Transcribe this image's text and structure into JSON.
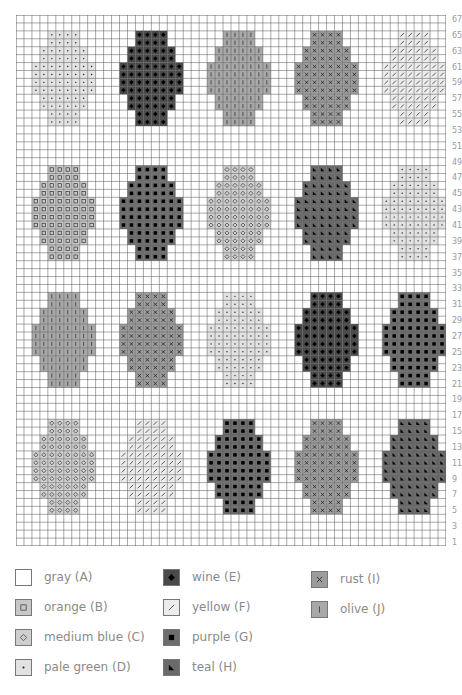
{
  "chart_data": {
    "type": "heatmap",
    "title": "",
    "grid": {
      "columns": 54,
      "rows": 67
    },
    "y_tick_labels": [
      "67",
      "65",
      "63",
      "61",
      "59",
      "57",
      "55",
      "53",
      "51",
      "49",
      "47",
      "45",
      "43",
      "41",
      "39",
      "37",
      "35",
      "33",
      "31",
      "29",
      "27",
      "25",
      "23",
      "21",
      "19",
      "17",
      "15",
      "13",
      "11",
      "9",
      "7",
      "5",
      "3",
      "1"
    ],
    "egg_shape_row_widths": [
      4,
      4,
      6,
      6,
      8,
      8,
      8,
      8,
      6,
      6,
      4,
      4
    ],
    "egg_rows": [
      {
        "top_row": 65,
        "bottom_row": 54,
        "eggs": [
          "D",
          "E",
          "J",
          "I",
          "F"
        ]
      },
      {
        "top_row": 48,
        "bottom_row": 37,
        "eggs": [
          "B",
          "G",
          "C",
          "H",
          "D"
        ]
      },
      {
        "top_row": 32,
        "bottom_row": 21,
        "eggs": [
          "J",
          "I",
          "D",
          "E",
          "G"
        ]
      },
      {
        "top_row": 16,
        "bottom_row": 5,
        "eggs": [
          "C",
          "F",
          "G",
          "I",
          "H"
        ]
      }
    ],
    "egg_center_columns": [
      6,
      17,
      28,
      39,
      50
    ]
  },
  "legend": {
    "items": [
      {
        "key": "A",
        "label": "gray (A)",
        "symbol": "blank",
        "fill": "#ffffff"
      },
      {
        "key": "B",
        "label": "orange (B)",
        "symbol": "square-outline",
        "fill": "#c8c8c8"
      },
      {
        "key": "C",
        "label": "medium blue (C)",
        "symbol": "diamond-outline",
        "fill": "#cfcfcf"
      },
      {
        "key": "D",
        "label": "pale green (D)",
        "symbol": "dot",
        "fill": "#e2e2e2"
      },
      {
        "key": "E",
        "label": "wine (E)",
        "symbol": "diamond-filled",
        "fill": "#4a4a4a"
      },
      {
        "key": "F",
        "label": "yellow (F)",
        "symbol": "slash",
        "fill": "#ececec"
      },
      {
        "key": "G",
        "label": "purple (G)",
        "symbol": "square-filled",
        "fill": "#6e6e6e"
      },
      {
        "key": "H",
        "label": "teal (H)",
        "symbol": "triangle",
        "fill": "#6a6a6a"
      },
      {
        "key": "I",
        "label": "rust (I)",
        "symbol": "x",
        "fill": "#9c9c9c"
      },
      {
        "key": "J",
        "label": "olive (J)",
        "symbol": "bar",
        "fill": "#a8a8a8"
      }
    ]
  }
}
